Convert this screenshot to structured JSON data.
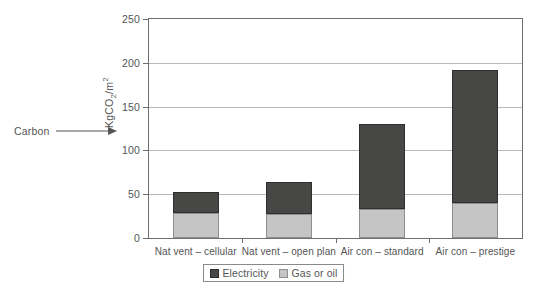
{
  "annotation": {
    "label": "Carbon",
    "arrow_icon": "arrow-right-icon"
  },
  "chart_data": {
    "type": "bar",
    "stacked": true,
    "title": "",
    "xlabel": "",
    "ylabel": "KgCO2/m2",
    "ylabel_parts": {
      "prefix": "KgCO",
      "sub": "2",
      "mid": "/m",
      "sup": "2"
    },
    "ylim": [
      0,
      250
    ],
    "yticks": [
      0,
      50,
      100,
      150,
      200,
      250
    ],
    "ytick_labels": [
      "0",
      "50",
      "100",
      "150",
      "200",
      "250"
    ],
    "grid": true,
    "legend_position": "bottom-center",
    "categories": [
      "Nat vent – cellular",
      "Nat vent – open plan",
      "Air con – standard",
      "Air con – prestige"
    ],
    "series": [
      {
        "name": "Gas or oil",
        "color": "#c5c5c5",
        "values": [
          28,
          27,
          33,
          40
        ]
      },
      {
        "name": "Electricity",
        "color": "#474745",
        "values": [
          25,
          37,
          97,
          152
        ]
      }
    ],
    "totals": [
      53,
      64,
      130,
      192
    ]
  },
  "legend": {
    "items": [
      {
        "label": "Electricity",
        "swatch": "electricity"
      },
      {
        "label": "Gas or oil",
        "swatch": "gas"
      }
    ]
  }
}
